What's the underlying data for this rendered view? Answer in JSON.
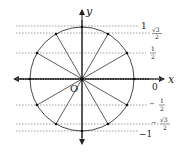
{
  "diagram": {
    "axes": {
      "x_label": "x",
      "y_label": "y",
      "origin_label": "O"
    },
    "center": [
      82,
      79
    ],
    "radius": 52,
    "angles_deg": [
      0,
      30,
      60,
      90,
      120,
      150,
      180,
      210,
      240,
      270,
      300,
      330
    ],
    "sine_levels": [
      {
        "value": 1,
        "label": "1",
        "y": 26
      },
      {
        "value": 0.866,
        "label_num": "√3",
        "label_den": "2",
        "y": 33
      },
      {
        "value": 0.5,
        "label_num": "1",
        "label_den": "2",
        "y": 53
      },
      {
        "value": 0,
        "label": "0",
        "y": 79
      },
      {
        "value": -0.5,
        "label_sign": "−",
        "label_num": "1",
        "label_den": "2",
        "y": 105
      },
      {
        "value": -0.866,
        "label_sign": "−",
        "label_num": "√3",
        "label_den": "2",
        "y": 124
      },
      {
        "value": -1,
        "label": "−1",
        "y": 131
      }
    ],
    "colors": {
      "line": "#333333",
      "dashed": "#888888",
      "text": "#222222"
    }
  }
}
